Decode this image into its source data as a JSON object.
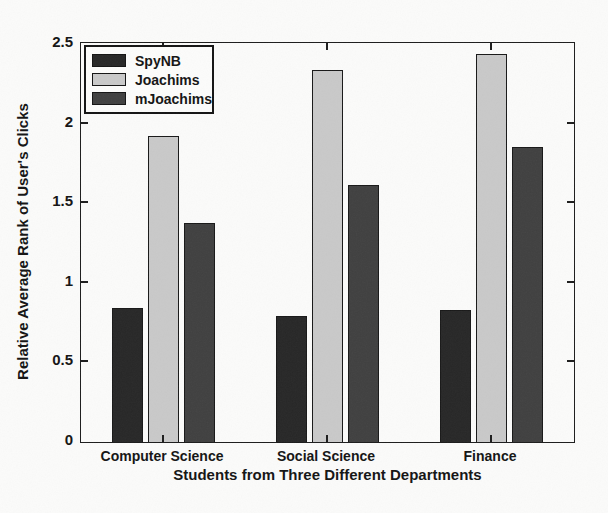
{
  "chart_data": {
    "type": "bar",
    "title": "",
    "xlabel": "Students from Three Different Departments",
    "ylabel": "Relative Average Rank of User's Clicks",
    "categories": [
      "Computer Science",
      "Social Science",
      "Finance"
    ],
    "series": [
      {
        "name": "SpyNB",
        "color": "#272727",
        "values": [
          0.84,
          0.79,
          0.83
        ]
      },
      {
        "name": "Joachims",
        "color": "#c9c9c9",
        "values": [
          1.92,
          2.33,
          2.43
        ]
      },
      {
        "name": "mJoachims",
        "color": "#404040",
        "values": [
          1.37,
          1.61,
          1.85
        ]
      }
    ],
    "ylim": [
      0,
      2.5
    ],
    "y_ticks": [
      0,
      0.5,
      1,
      1.5,
      2,
      2.5
    ],
    "y_tick_labels": [
      "0",
      "0.5",
      "1",
      "1.5",
      "2",
      "2.5"
    ],
    "grid": false,
    "legend_position": "top-left",
    "axis_color": "#1c1c1c",
    "background_color": "#fbfbfa"
  }
}
